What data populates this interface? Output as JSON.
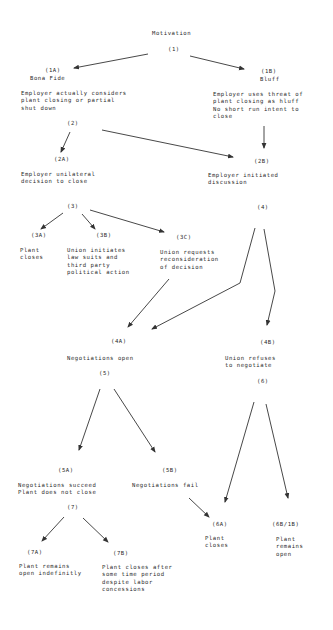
{
  "diagram": {
    "root": {
      "title": "Motivation",
      "id": "(1)"
    },
    "nodes": {
      "n1A": {
        "id": "(1A)",
        "label": "Bona Fide",
        "text": "Employer actually considers\nplant closing or partial\nshut down"
      },
      "n1B": {
        "id": "(1B)",
        "label": "Bluff",
        "text": "Employer uses threat of\nplant closing as hluff\nNo short run intent to\nclose"
      },
      "n2": {
        "id": "(2)"
      },
      "n2A": {
        "id": "(2A)",
        "text": "Employer unilateral\ndecision to close"
      },
      "n2B": {
        "id": "(2B)",
        "text": "Employer initiated\ndiscussion"
      },
      "n3": {
        "id": "(3)"
      },
      "n4": {
        "id": "(4)"
      },
      "n3A": {
        "id": "(3A)",
        "text": "Plant\ncloses"
      },
      "n3B": {
        "id": "(3B)",
        "text": "Union initiates\nlaw suits and\nthird party\npolitical action"
      },
      "n3C": {
        "id": "(3C)",
        "text": "Union requests\nreconsideration\nof decision"
      },
      "n4A": {
        "id": "(4A)",
        "text": "Negotiations open"
      },
      "n5": {
        "id": "(5)"
      },
      "n4B": {
        "id": "(4B)",
        "text": "Union refuses\nto negotiate"
      },
      "n6": {
        "id": "(6)"
      },
      "n5A": {
        "id": "(5A)",
        "text": "Negotiations succeed\nPlant does not close"
      },
      "n5B": {
        "id": "(5B)",
        "text": "Negotiations fail"
      },
      "n7": {
        "id": "(7)"
      },
      "n6A": {
        "id": "(6A)",
        "text": "Plant\ncloses"
      },
      "n6B": {
        "id": "(6B/1B)",
        "text": "Plant\nremains\nopen"
      },
      "n7A": {
        "id": "(7A)",
        "text": "Plant remains\nopen indefinitly"
      },
      "n7B": {
        "id": "(7B)",
        "text": "Plant closes after\nsome time period\ndespite labor\nconcessions"
      }
    },
    "edges": [
      [
        "(1)",
        "(1A)"
      ],
      [
        "(1)",
        "(1B)"
      ],
      [
        "(2)",
        "(2A)"
      ],
      [
        "(2)",
        "(2B)"
      ],
      [
        "(1B)",
        "(2B)"
      ],
      [
        "(3)",
        "(3A)"
      ],
      [
        "(3)",
        "(3B)"
      ],
      [
        "(3)",
        "(3C)"
      ],
      [
        "(3C)",
        "(4A)"
      ],
      [
        "(4)",
        "(4A)"
      ],
      [
        "(4)",
        "(4B)"
      ],
      [
        "(5)",
        "(5A)"
      ],
      [
        "(5)",
        "(5B)"
      ],
      [
        "(5B)",
        "(6A)"
      ],
      [
        "(6)",
        "(6A)"
      ],
      [
        "(6)",
        "(6B/1B)"
      ],
      [
        "(7)",
        "(7A)"
      ],
      [
        "(7)",
        "(7B)"
      ]
    ],
    "colors": {
      "ink": "#2a2a2a",
      "background": "#ffffff"
    }
  }
}
